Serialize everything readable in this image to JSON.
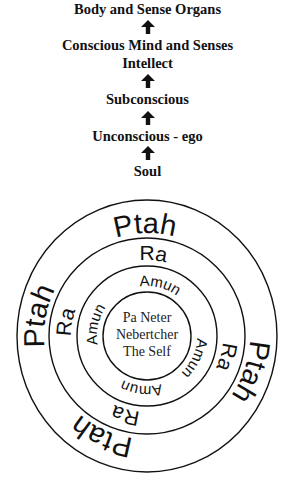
{
  "hierarchy": {
    "levels": [
      {
        "label": "Body and Sense Organs"
      },
      {
        "label": "Conscious Mind and Senses"
      },
      {
        "label": "Intellect"
      },
      {
        "label": "Subconscious"
      },
      {
        "label": "Unconscious - ego"
      },
      {
        "label": "Soul"
      }
    ],
    "arrow_icon": "up-arrow-icon"
  },
  "circles": {
    "outer_ring": {
      "label": "Ptah",
      "repeat": 4
    },
    "middle_ring": {
      "label": "Ra",
      "repeat": 4
    },
    "inner_ring": {
      "label": "Amun",
      "repeat": 4
    },
    "center": {
      "line1": "Pa Neter",
      "line2": "Nebertcher",
      "line3": "The Self"
    }
  },
  "colors": {
    "ink": "#111111",
    "background": "#ffffff"
  }
}
